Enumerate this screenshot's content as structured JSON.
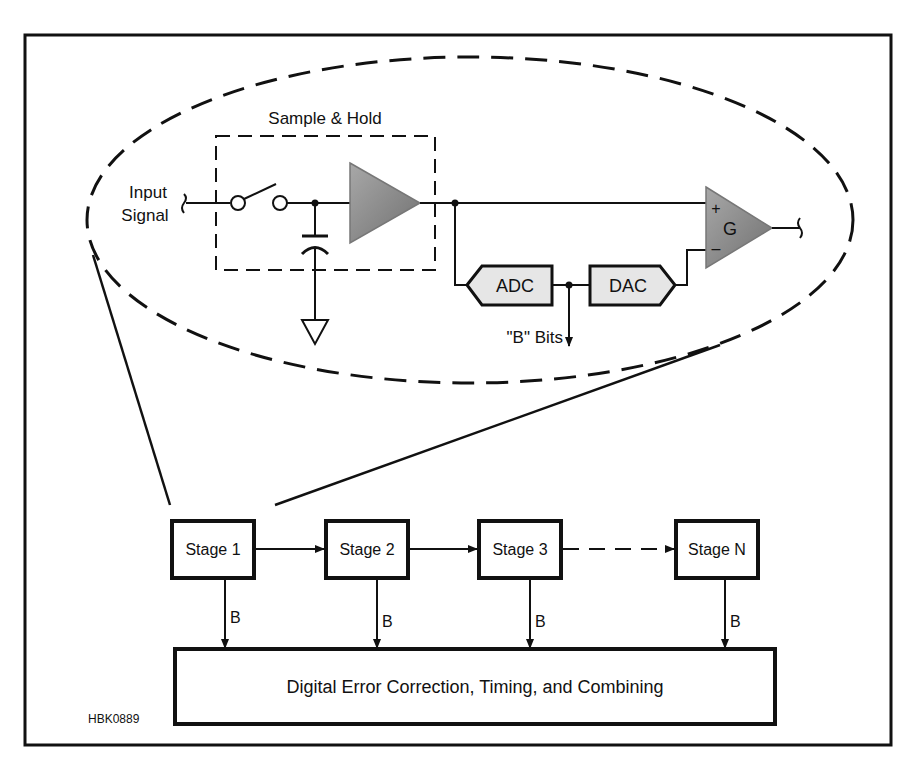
{
  "figure_id": "HBK0889",
  "detail": {
    "sample_hold_label": "Sample & Hold",
    "input_label_line1": "Input",
    "input_label_line2": "Signal",
    "adc_label": "ADC",
    "dac_label": "DAC",
    "bits_label": "\"B\" Bits",
    "gain_label": "G",
    "plus_label": "+",
    "minus_label": "–"
  },
  "pipeline": {
    "stages": [
      {
        "label": "Stage 1",
        "output_label": "B"
      },
      {
        "label": "Stage 2",
        "output_label": "B"
      },
      {
        "label": "Stage 3",
        "output_label": "B"
      },
      {
        "label": "Stage N",
        "output_label": "B"
      }
    ],
    "combiner_label": "Digital Error Correction, Timing, and Combining"
  },
  "colors": {
    "line": "#111111",
    "amp_fill": "#8c8c8c",
    "box_fill": "#e6e6e6"
  }
}
